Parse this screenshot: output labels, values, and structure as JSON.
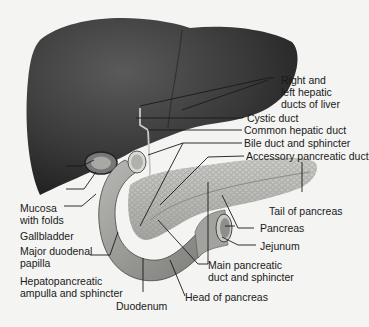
{
  "diagram": {
    "colors": {
      "liver": "#3a3a3a",
      "pancreas": "#b8b8b4",
      "duodenum": "#9a9a96",
      "background": "#f4f4f2",
      "leader": "#1a1a1a"
    },
    "labels": {
      "right_left_hepatic_line1": "Right and",
      "right_left_hepatic_line2": "left hepatic",
      "right_left_hepatic_line3": "ducts of liver",
      "cystic_duct": "Cystic duct",
      "common_hepatic_duct": "Common hepatic duct",
      "bile_duct": "Bile duct and sphincter",
      "accessory_pancreatic_duct": "Accessory pancreatic duct",
      "mucosa_line1": "Mucosa",
      "mucosa_line2": "with folds",
      "gallbladder": "Gallbladder",
      "major_papilla_line1": "Major duodenal",
      "major_papilla_line2": "papilla",
      "hepatopancreatic_line1": "Hepatopancreatic",
      "hepatopancreatic_line2": "ampulla and sphincter",
      "duodenum": "Duodenum",
      "tail_of_pancreas": "Tail of pancreas",
      "pancreas": "Pancreas",
      "jejunum": "Jejunum",
      "main_pancreatic_line1": "Main pancreatic",
      "main_pancreatic_line2": "duct and sphincter",
      "head_of_pancreas": "Head of pancreas"
    }
  }
}
